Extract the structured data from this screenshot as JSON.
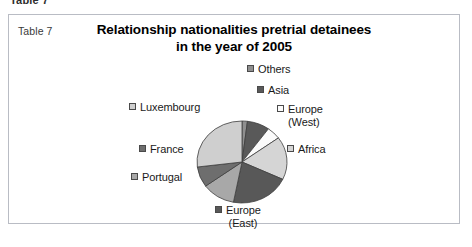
{
  "clipped_caption": "Table 7",
  "figure": {
    "table_number": "Table 7",
    "title_line1": "Relationship nationalities pretrial detainees",
    "title_line2": "in the year of 2005"
  },
  "colors": {
    "slice_others": "#8f8f8f",
    "slice_asia": "#595959",
    "slice_europe_west": "#fbfbfb",
    "slice_africa": "#d5d5d5",
    "slice_europe_east": "#585858",
    "slice_portugal": "#a8a8a8",
    "slice_france": "#6e6e6e",
    "slice_luxembourg": "#cfcfcf",
    "outline": "#3f3f3f",
    "frame_border": "#b9bcc4",
    "text": "#1a1a1a"
  },
  "chart_data": {
    "type": "pie",
    "title": "Relationship nationalities pretrial detainees in the year of 2005",
    "xlabel": "",
    "ylabel": "",
    "legend_position": "around-slices",
    "grid": false,
    "labels": [
      "Others",
      "Asia",
      "Europe (West)",
      "Africa",
      "Europe (East)",
      "Portugal",
      "France",
      "Luxembourg"
    ],
    "values": [
      2,
      8,
      5,
      17,
      21,
      12,
      8,
      27
    ],
    "slices": [
      {
        "label": "Others",
        "label_line1": "Others",
        "label_line2": "",
        "value": 2,
        "start_angle": 0,
        "end_angle": 7,
        "color": "#8f8f8f"
      },
      {
        "label": "Asia",
        "label_line1": "Asia",
        "label_line2": "",
        "value": 8,
        "start_angle": 7,
        "end_angle": 36,
        "color": "#595959"
      },
      {
        "label": "Europe (West)",
        "label_line1": "Europe",
        "label_line2": "(West)",
        "value": 5,
        "start_angle": 36,
        "end_angle": 54,
        "color": "#fbfbfb"
      },
      {
        "label": "Africa",
        "label_line1": "Africa",
        "label_line2": "",
        "value": 17,
        "start_angle": 54,
        "end_angle": 115,
        "color": "#d5d5d5"
      },
      {
        "label": "Europe (East)",
        "label_line1": "Europe",
        "label_line2": "(East)",
        "value": 21,
        "start_angle": 115,
        "end_angle": 191,
        "color": "#585858"
      },
      {
        "label": "Portugal",
        "label_line1": "Portugal",
        "label_line2": "",
        "value": 12,
        "start_angle": 191,
        "end_angle": 234,
        "color": "#a8a8a8"
      },
      {
        "label": "France",
        "label_line1": "France",
        "label_line2": "",
        "value": 8,
        "start_angle": 234,
        "end_angle": 263,
        "color": "#6e6e6e"
      },
      {
        "label": "Luxembourg",
        "label_line1": "Luxembourg",
        "label_line2": "",
        "value": 27,
        "start_angle": 263,
        "end_angle": 360,
        "color": "#cfcfcf"
      }
    ]
  }
}
